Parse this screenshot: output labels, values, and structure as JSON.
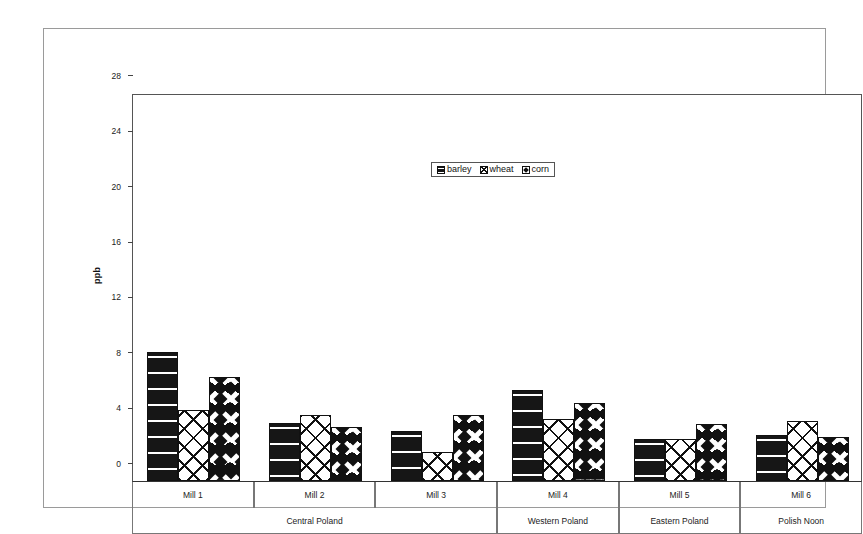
{
  "chart_data": {
    "type": "bar",
    "title": "",
    "subtitle": "",
    "xlabel": "",
    "ylabel": "ppb",
    "ylim": [
      0,
      28
    ],
    "yticks": [
      0,
      4,
      8,
      12,
      16,
      20,
      24,
      28
    ],
    "grid": false,
    "legend_position": "upper center",
    "categories": [
      "Mill 1",
      "Mill 2",
      "Mill 3",
      "Mill 4",
      "Mill 5",
      "Mill 6"
    ],
    "group_labels": [
      {
        "label": "Central Poland",
        "categories": [
          "Mill 1",
          "Mill 2",
          "Mill 3"
        ]
      },
      {
        "label": "Western Poland",
        "categories": [
          "Mill 4"
        ]
      },
      {
        "label": "Eastern Poland",
        "categories": [
          "Mill 5"
        ]
      },
      {
        "label": "Polish Noon",
        "categories": [
          "Mill 6"
        ]
      }
    ],
    "series": [
      {
        "name": "barley",
        "pattern": "dark-brick",
        "values": [
          9.3,
          4.2,
          3.6,
          6.6,
          3.0,
          3.3
        ]
      },
      {
        "name": "wheat",
        "pattern": "white-crosshatch",
        "values": [
          5.1,
          4.8,
          2.1,
          4.5,
          3.0,
          4.3
        ]
      },
      {
        "name": "corn",
        "pattern": "white-diamond",
        "values": [
          7.5,
          3.9,
          4.8,
          5.6,
          4.1,
          3.2
        ]
      }
    ]
  },
  "legend": {
    "entries": [
      {
        "label": "barley"
      },
      {
        "label": "wheat"
      },
      {
        "label": "corn"
      }
    ]
  },
  "axis": {
    "y_title": "ppb",
    "y_tick_labels": [
      "28",
      "24",
      "20",
      "16",
      "12",
      "8",
      "4",
      "0"
    ]
  }
}
